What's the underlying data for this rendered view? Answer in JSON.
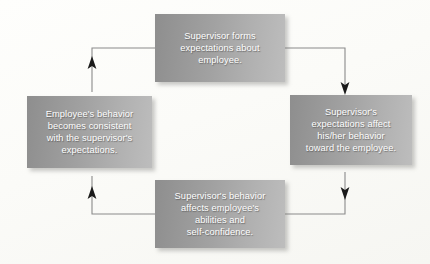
{
  "diagram": {
    "type": "cycle-flowchart",
    "direction": "clockwise",
    "background_color": "#fdfdfb",
    "box_gradient_start": "#8e8e8e",
    "box_gradient_end": "#bdbdbd",
    "text_color": "#ffffff",
    "connector_color": "#8a8a8a",
    "arrowhead_color": "#1a1a1a",
    "nodes": {
      "top": {
        "id": "supervisor-forms-expectations",
        "text": "Supervisor forms\nexpectations about\nemployee."
      },
      "right": {
        "id": "expectations-affect-behavior",
        "text": "Supervisor's\nexpectations affect\nhis/her behavior\ntoward the employee."
      },
      "bottom": {
        "id": "behavior-affects-abilities",
        "text": "Supervisor's behavior\naffects employee's\nabilities and\nself-confidence."
      },
      "left": {
        "id": "employee-behavior-consistent",
        "text": "Employee's behavior\nbecomes consistent\nwith the supervisor's\nexpectations."
      }
    },
    "edges": [
      {
        "id": "edge-top-to-right",
        "from": "top",
        "to": "right",
        "arrow": "down"
      },
      {
        "id": "edge-right-to-bottom",
        "from": "right",
        "to": "bottom",
        "arrow": "down"
      },
      {
        "id": "edge-bottom-to-left",
        "from": "bottom",
        "to": "left",
        "arrow": "up"
      },
      {
        "id": "edge-left-to-top",
        "from": "left",
        "to": "top",
        "arrow": "up"
      }
    ]
  }
}
